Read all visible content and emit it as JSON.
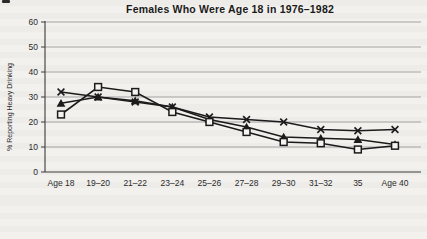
{
  "chart_data": {
    "type": "line",
    "title": "Females Who Were Age 18 in 1976–1982",
    "ylabel": "% Reporting Heavy Drinking",
    "xlabel": "",
    "ylim": [
      0,
      60
    ],
    "yticks": [
      0,
      10,
      20,
      30,
      40,
      50,
      60
    ],
    "grid": true,
    "legend_position": "none",
    "categories": [
      "Age 18",
      "19–20",
      "21–22",
      "23–24",
      "25–26",
      "27–28",
      "29–30",
      "31–32",
      "35",
      "Age 40"
    ],
    "series": [
      {
        "name": "cohort-asterisk-marker",
        "marker": "asterisk",
        "values": [
          32,
          30,
          28,
          26,
          22,
          21,
          20,
          17,
          16.5,
          17
        ]
      },
      {
        "name": "cohort-triangle-marker",
        "marker": "triangle-filled",
        "values": [
          27.5,
          30,
          28.5,
          26,
          21,
          18,
          14,
          13.5,
          13,
          11
        ]
      },
      {
        "name": "cohort-square-marker",
        "marker": "square-open",
        "values": [
          23,
          34,
          32,
          24,
          20,
          16,
          12,
          11.5,
          9,
          10.5
        ]
      }
    ],
    "colors": {
      "line": "#1b1b1b",
      "grid": "#9b9b9b",
      "axis": "#3a3a3a",
      "tick_text": "#2a2a2a",
      "marker_fill_open": "#f5f4f1",
      "background": "#f2f1ee"
    }
  }
}
